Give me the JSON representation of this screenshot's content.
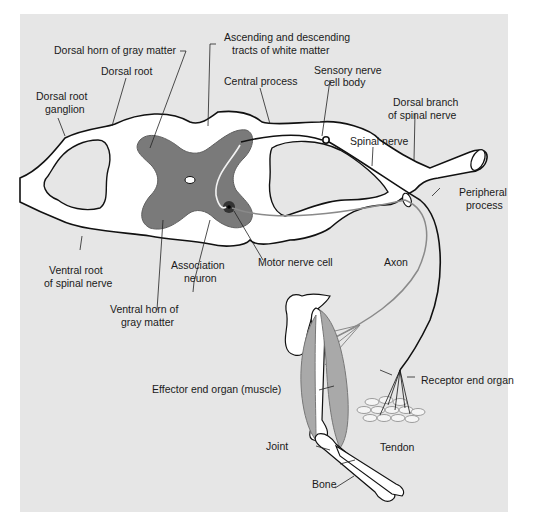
{
  "figure": {
    "colors": {
      "panel_bg": "#e6e6e6",
      "white_matter": "#ffffff",
      "gray_matter": "#7a7a7a",
      "outline": "#111111",
      "motor_axon": "#8a8a8a",
      "muscle": "#9a9a9a"
    },
    "labels": {
      "dorsal_horn": "Dorsal horn of gray matter",
      "tracts_line1": "Ascending and descending",
      "tracts_line2": "tracts of white matter",
      "dorsal_root": "Dorsal root",
      "central_process": "Central process",
      "sensory_cell_line1": "Sensory nerve",
      "sensory_cell_line2": "cell body",
      "drg_line1": "Dorsal root",
      "drg_line2": "ganglion",
      "dorsal_branch_line1": "Dorsal branch",
      "dorsal_branch_line2": "of spinal nerve",
      "spinal_nerve": "Spinal nerve",
      "peripheral_line1": "Peripheral",
      "peripheral_line2": "process",
      "ventral_root_line1": "Ventral root",
      "ventral_root_line2": "of spinal nerve",
      "association_line1": "Association",
      "association_line2": "neuron",
      "motor_cell": "Motor nerve cell",
      "axon": "Axon",
      "ventral_horn_line1": "Ventral horn of",
      "ventral_horn_line2": "gray matter",
      "effector": "Effector end organ (muscle)",
      "receptor": "Receptor end organ",
      "joint": "Joint",
      "tendon": "Tendon",
      "bone": "Bone"
    }
  }
}
